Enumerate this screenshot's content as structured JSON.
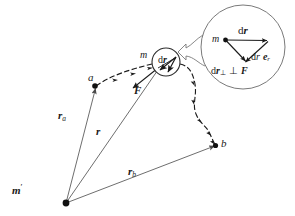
{
  "figure": {
    "background_color": "#ffffff",
    "ink_color": "#1a1a1a",
    "curve_color": "#555555"
  },
  "labels": {
    "point_a": "a",
    "point_b": "b",
    "source_mass": "m",
    "source_mass_prime": "m",
    "prime_mark": "′",
    "moving_mass": "m",
    "vector_ra": "r",
    "vector_ra_sub": "a",
    "vector_rb": "r",
    "vector_rb_sub": "b",
    "vector_r": "r",
    "force": "F",
    "dr_small_d": "d",
    "dr_small_r": "r"
  },
  "inset": {
    "vertex_mass": "m",
    "top_vector_d": "d",
    "top_vector_r": "r",
    "radial_label_d": "d",
    "radial_label_r": "r",
    "radial_label_e": "e",
    "radial_label_e_sub": "r",
    "perp_label_d": "d",
    "perp_label_r": "r",
    "perp_label_sub": "⊥",
    "perp_label_perp": "⊥",
    "perp_label_F": "F"
  },
  "geometry": {
    "origin_point": [
      66,
      203
    ],
    "point_a": [
      95,
      86
    ],
    "point_b": [
      216,
      145
    ],
    "dr_circle_center": [
      166,
      62
    ],
    "dr_circle_radius": 14,
    "inset_circle_center": [
      243,
      47
    ],
    "inset_circle_radius": 42
  }
}
